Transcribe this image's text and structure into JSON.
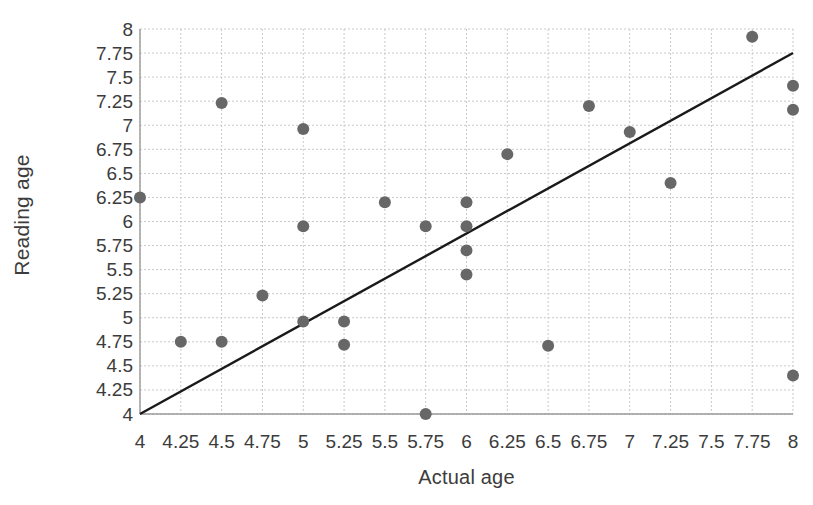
{
  "chart_data": {
    "type": "scatter",
    "title": "",
    "xlabel": "Actual age",
    "ylabel": "Reading age",
    "xlim": [
      4,
      8
    ],
    "ylim": [
      4,
      8
    ],
    "xticks": [
      "4",
      "4.25",
      "4.5",
      "4.75",
      "5",
      "5.25",
      "5.5",
      "5.75",
      "6",
      "6.25",
      "6.5",
      "6.75",
      "7",
      "7.25",
      "7.5",
      "7.75",
      "8"
    ],
    "yticks": [
      "8",
      "7.75",
      "7.5",
      "7.25",
      "7",
      "6.75",
      "6.5",
      "6.25",
      "6",
      "5.75",
      "5.5",
      "5.25",
      "5",
      "4.75",
      "4.5",
      "4.25",
      "4"
    ],
    "grid": true,
    "legend": false,
    "marker_color": "#676767",
    "marker_size": 11,
    "line_color": "#1a1a1a",
    "points": [
      {
        "x": 4,
        "y": 6.25
      },
      {
        "x": 4.25,
        "y": 4.75
      },
      {
        "x": 4.5,
        "y": 7.23
      },
      {
        "x": 4.5,
        "y": 4.75
      },
      {
        "x": 4.75,
        "y": 5.23
      },
      {
        "x": 5,
        "y": 6.96
      },
      {
        "x": 5,
        "y": 5.95
      },
      {
        "x": 5,
        "y": 4.96
      },
      {
        "x": 5.25,
        "y": 4.96
      },
      {
        "x": 5.25,
        "y": 4.72
      },
      {
        "x": 5.5,
        "y": 6.2
      },
      {
        "x": 5.75,
        "y": 5.95
      },
      {
        "x": 5.75,
        "y": 4.0
      },
      {
        "x": 6,
        "y": 6.2
      },
      {
        "x": 6,
        "y": 5.95
      },
      {
        "x": 6,
        "y": 5.7
      },
      {
        "x": 6,
        "y": 5.45
      },
      {
        "x": 6.25,
        "y": 6.7
      },
      {
        "x": 6.5,
        "y": 4.71
      },
      {
        "x": 6.75,
        "y": 7.2
      },
      {
        "x": 7,
        "y": 6.93
      },
      {
        "x": 7.25,
        "y": 6.4
      },
      {
        "x": 7.75,
        "y": 7.92
      },
      {
        "x": 8,
        "y": 7.41
      },
      {
        "x": 8,
        "y": 7.16
      },
      {
        "x": 8,
        "y": 4.4
      }
    ],
    "trendline": {
      "x0": 4,
      "y0": 4,
      "x1": 8,
      "y1": 7.75
    }
  }
}
